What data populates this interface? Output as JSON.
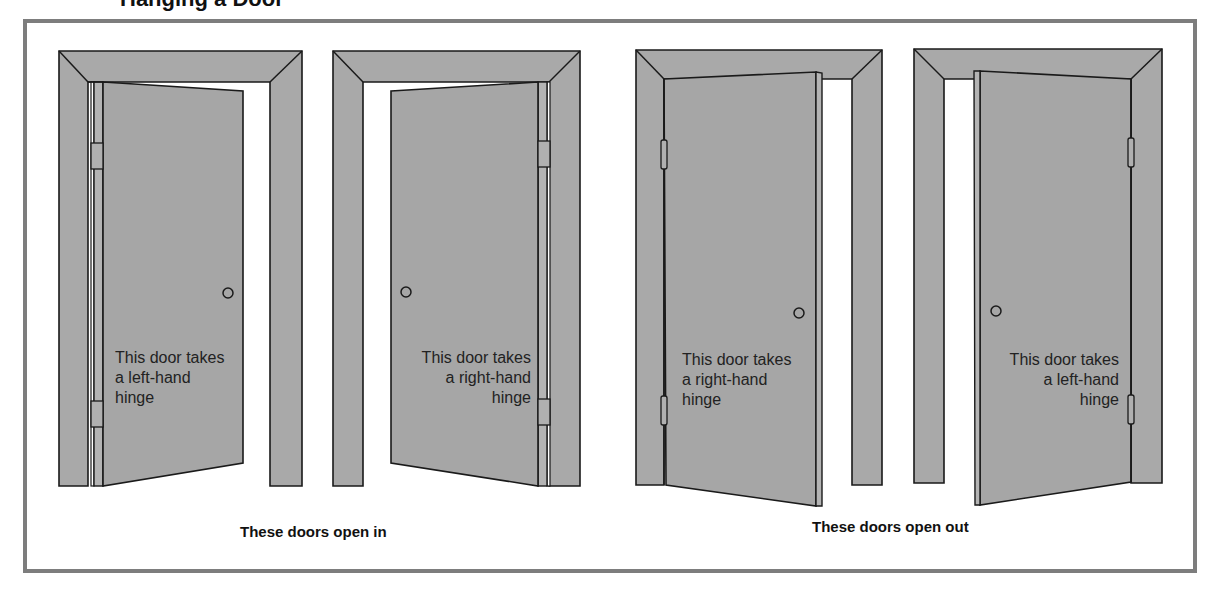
{
  "figure": {
    "title_fragment": "Hanging a Door",
    "colors": {
      "border": "#7d7d7d",
      "panel_gray": "#a6a6a6",
      "outline": "#1a1a1a",
      "background": "#ffffff"
    },
    "doors": [
      {
        "label_lines": [
          "This door takes",
          "a left-hand",
          "hinge"
        ],
        "hinge": "left-hand",
        "opens": "in",
        "icon": "door-open-in-left-hinge-icon"
      },
      {
        "label_lines": [
          "This door takes",
          "a right-hand",
          "hinge"
        ],
        "hinge": "right-hand",
        "opens": "in",
        "icon": "door-open-in-right-hinge-icon"
      },
      {
        "label_lines": [
          "This door takes",
          "a right-hand",
          "hinge"
        ],
        "hinge": "right-hand",
        "opens": "out",
        "icon": "door-open-out-left-hinge-icon"
      },
      {
        "label_lines": [
          "This door takes",
          "a left-hand",
          "hinge"
        ],
        "hinge": "left-hand",
        "opens": "out",
        "icon": "door-open-out-right-hinge-icon"
      }
    ],
    "captions": {
      "open_in": "These doors open in",
      "open_out": "These doors open out"
    }
  }
}
